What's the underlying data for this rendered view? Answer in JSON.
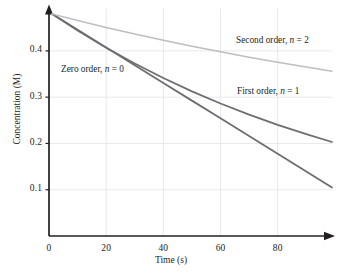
{
  "chart_data": {
    "type": "line",
    "title": "",
    "xlabel": "Time (s)",
    "ylabel": "Concentration (M)",
    "xlim": [
      0,
      99
    ],
    "ylim": [
      0,
      0.5
    ],
    "xticks": [
      0,
      20,
      40,
      60,
      80
    ],
    "xtick_labels": [
      "0",
      "20",
      "40",
      "60",
      "80"
    ],
    "yticks": [
      0.1,
      0.2,
      0.3,
      0.4
    ],
    "ytick_labels": [
      "0.1",
      "0.2",
      "0.3",
      "0.4"
    ],
    "grid": true,
    "grid_color": "#e9e9ea",
    "legend": "inline-annotations",
    "initial_concentration": 0.48,
    "series": [
      {
        "name": "Zero order",
        "order": 0,
        "label_text": "Zero order, ",
        "label_var": "n",
        "label_eq": " = 0",
        "color": "#6d6e71",
        "width": 1.8,
        "label_x": 61,
        "label_y": 64,
        "x": [
          1,
          10,
          20,
          30,
          40,
          50,
          60,
          70,
          80,
          90,
          99
        ],
        "y": [
          0.48,
          0.4455,
          0.4073,
          0.369,
          0.3308,
          0.2925,
          0.2543,
          0.216,
          0.1778,
          0.1395,
          0.105
        ]
      },
      {
        "name": "First order",
        "order": 1,
        "label_text": "First order, ",
        "label_var": "n",
        "label_eq": " = 1",
        "color": "#6d6e71",
        "width": 1.8,
        "label_x": 237,
        "label_y": 86,
        "x": [
          1,
          10,
          20,
          30,
          40,
          50,
          60,
          70,
          80,
          90,
          99
        ],
        "y": [
          0.48,
          0.4441,
          0.4068,
          0.3726,
          0.3413,
          0.3126,
          0.2863,
          0.2622,
          0.2402,
          0.22,
          0.2031
        ]
      },
      {
        "name": "Second order",
        "order": 2,
        "label_text": "Second order, ",
        "label_var": "n",
        "label_eq": " = 2",
        "color": "#bcbec0",
        "width": 1.5,
        "label_x": 236,
        "label_y": 35,
        "x": [
          1,
          10,
          20,
          30,
          40,
          50,
          60,
          70,
          80,
          90,
          99
        ],
        "y": [
          0.48,
          0.4658,
          0.4506,
          0.4363,
          0.4228,
          0.41,
          0.3979,
          0.3864,
          0.3755,
          0.3651,
          0.3562
        ]
      }
    ]
  },
  "axes": {
    "axis_color": "#231f20",
    "arrow_x": "right",
    "arrow_y": "up"
  }
}
